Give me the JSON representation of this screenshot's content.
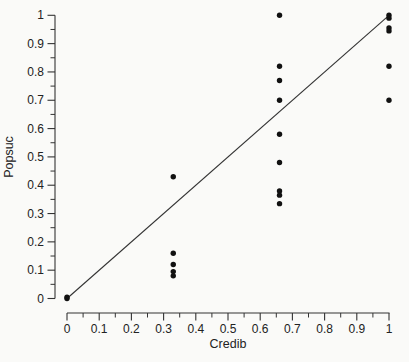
{
  "page": {
    "background": "#fafaf8"
  },
  "chart_data": {
    "type": "scatter",
    "title": "",
    "xlabel": "Credib",
    "ylabel": "Popsuc",
    "xlim": [
      0,
      1
    ],
    "ylim": [
      0,
      1
    ],
    "grid": false,
    "legend": null,
    "x_ticks": [
      0,
      0.1,
      0.2,
      0.3,
      0.4,
      0.5,
      0.6,
      0.7,
      0.8,
      0.9,
      1
    ],
    "y_ticks": [
      0,
      0.1,
      0.2,
      0.3,
      0.4,
      0.5,
      0.6,
      0.7,
      0.8,
      0.9,
      1
    ],
    "x_tick_labels": [
      "0",
      "0.1",
      "0.2",
      "0.3",
      "0.4",
      "0.5",
      "0.6",
      "0.7",
      "0.8",
      "0.9",
      "1"
    ],
    "y_tick_labels": [
      "0",
      "0.1",
      "0.2",
      "0.3",
      "0.4",
      "0.5",
      "0.6",
      "0.7",
      "0.8",
      "0.9",
      "1"
    ],
    "minor_ticks_x": [
      0.05,
      0.15,
      0.25,
      0.35,
      0.45,
      0.55,
      0.65,
      0.75,
      0.85,
      0.95
    ],
    "minor_ticks_y": [
      0.05,
      0.15,
      0.25,
      0.35,
      0.45,
      0.55,
      0.65,
      0.75,
      0.85,
      0.95
    ],
    "identity_line": {
      "from": [
        0,
        0
      ],
      "to": [
        1,
        1
      ]
    },
    "points": [
      [
        0,
        0
      ],
      [
        0,
        0.005
      ],
      [
        0.33,
        0.43
      ],
      [
        0.33,
        0.16
      ],
      [
        0.33,
        0.12
      ],
      [
        0.33,
        0.095
      ],
      [
        0.33,
        0.08
      ],
      [
        0.66,
        1.0
      ],
      [
        0.66,
        0.82
      ],
      [
        0.66,
        0.77
      ],
      [
        0.66,
        0.7
      ],
      [
        0.66,
        0.58
      ],
      [
        0.66,
        0.48
      ],
      [
        0.66,
        0.38
      ],
      [
        0.66,
        0.365
      ],
      [
        0.66,
        0.335
      ],
      [
        1,
        1.0
      ],
      [
        1,
        0.99
      ],
      [
        1,
        0.955
      ],
      [
        1,
        0.945
      ],
      [
        1,
        0.82
      ],
      [
        1,
        0.7
      ]
    ],
    "colors": {
      "point": "#111111",
      "line": "#333333",
      "axis": "#333333",
      "text": "#222222"
    }
  }
}
